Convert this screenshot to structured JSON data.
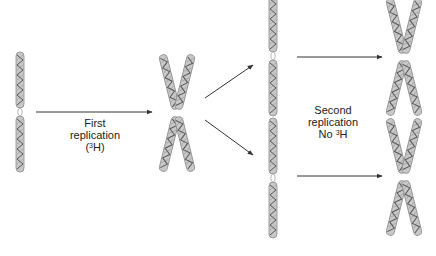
{
  "diagram": {
    "colors": {
      "chromatid_fill": "#c8c8c8",
      "chromatid_stroke": "#8a8a8a",
      "helix_stroke": "#555555",
      "arrow": "#333333",
      "text": "#222222"
    },
    "labels": {
      "first": {
        "line1": "First",
        "line2": "replication",
        "line3_pre": "(",
        "line3_sup": "3",
        "line3_post": "H)"
      },
      "second": {
        "line1": "Second",
        "line2": "replication",
        "line3_pre": "No ",
        "line3_sup": "3",
        "line3_post": "H"
      }
    },
    "stages": [
      {
        "name": "original-chromosome",
        "type": "single"
      },
      {
        "name": "first-replicated-chromosome",
        "type": "x"
      },
      {
        "name": "separated-chromatids",
        "type": "single-pair"
      },
      {
        "name": "second-replicated-chromosomes",
        "type": "x-pair"
      }
    ]
  }
}
